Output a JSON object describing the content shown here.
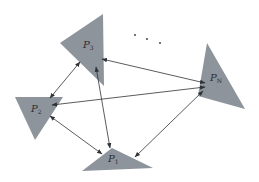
{
  "diagram": {
    "title": "",
    "colors": {
      "node_fill": "#8d949b",
      "edge": "#2f3236",
      "background": "#ffffff"
    },
    "nodes": [
      {
        "id": "P3",
        "label": "P",
        "sub": "3",
        "points": "103,14 60,43 104,86",
        "label_x": 83,
        "label_y": 48
      },
      {
        "id": "PN",
        "label": "P",
        "sub": "N",
        "points": "207,43 198,96 245,109",
        "label_x": 210,
        "label_y": 81
      },
      {
        "id": "P2",
        "label": "P",
        "sub": "2",
        "points": "15,97 63,97 35,140",
        "label_x": 31,
        "label_y": 112
      },
      {
        "id": "P1",
        "label": "P",
        "sub": "1",
        "points": "112,148 82,171 153,168",
        "label_x": 108,
        "label_y": 162
      }
    ],
    "edges": [
      {
        "from": "P3",
        "to": "PN",
        "x1": 102,
        "y1": 59,
        "x2": 205,
        "y2": 83
      },
      {
        "from": "P3",
        "to": "P2",
        "x1": 80,
        "y1": 62,
        "x2": 50,
        "y2": 98
      },
      {
        "from": "P3",
        "to": "P1",
        "x1": 96,
        "y1": 67,
        "x2": 110,
        "y2": 148
      },
      {
        "from": "P2",
        "to": "PN",
        "x1": 52,
        "y1": 105,
        "x2": 205,
        "y2": 87
      },
      {
        "from": "P2",
        "to": "P1",
        "x1": 50,
        "y1": 116,
        "x2": 102,
        "y2": 154
      },
      {
        "from": "PN",
        "to": "P1",
        "x1": 203,
        "y1": 91,
        "x2": 135,
        "y2": 157
      }
    ],
    "ellipsis": {
      "text": "· · ·",
      "dots": [
        {
          "x": 135,
          "y": 35
        },
        {
          "x": 147,
          "y": 39
        },
        {
          "x": 160,
          "y": 43
        }
      ]
    }
  }
}
